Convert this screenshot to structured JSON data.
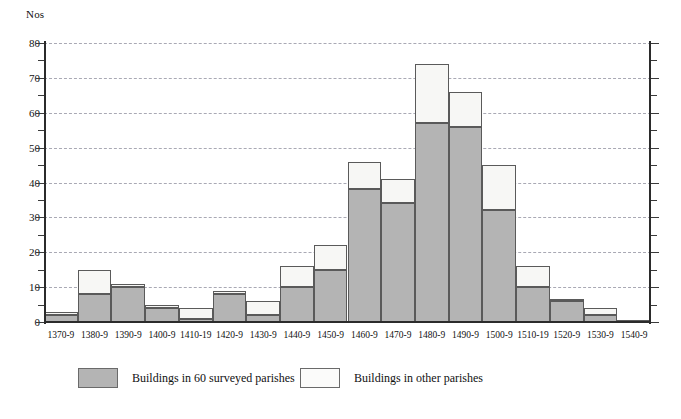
{
  "axis": {
    "unit_label": "Nos",
    "y_ticks": [
      "0",
      "10",
      "20",
      "30",
      "40",
      "50",
      "60",
      "70",
      "80"
    ],
    "y_minor_ticks": [
      "5",
      "15",
      "25",
      "35",
      "45",
      "55",
      "65",
      "75"
    ]
  },
  "legend": {
    "items": [
      {
        "label": "Buildings in 60 surveyed parishes",
        "swatch": "surveyed",
        "color": "#b4b4b4"
      },
      {
        "label": "Buildings in other parishes",
        "swatch": "other",
        "color": "#fbfbfa"
      }
    ]
  },
  "colors": {
    "surveyed_fill": "#b4b4b4",
    "other_fill": "#f7f7f5",
    "bar_border": "#5a5a5a",
    "gridline": "#a9a9b4",
    "axis": "#2b2b2b"
  },
  "chart_data": {
    "type": "bar",
    "title": "",
    "subtitle": "",
    "xlabel": "",
    "ylabel": "Nos",
    "ylim": [
      0,
      80
    ],
    "ytick_step": 10,
    "grid": true,
    "stacked": true,
    "legend_position": "bottom",
    "categories": [
      "1370-9",
      "1380-9",
      "1390-9",
      "1400-9",
      "1410-19",
      "1420-9",
      "1430-9",
      "1440-9",
      "1450-9",
      "1460-9",
      "1470-9",
      "1480-9",
      "1490-9",
      "1500-9",
      "1510-19",
      "1520-9",
      "1530-9",
      "1540-9"
    ],
    "series": [
      {
        "name": "Buildings in 60 surveyed parishes",
        "color": "#b4b4b4",
        "values": [
          2,
          8,
          10,
          4,
          1,
          8,
          2,
          10,
          15,
          38,
          34,
          57,
          56,
          32,
          10,
          6,
          2,
          0
        ]
      },
      {
        "name": "Buildings in other parishes",
        "color": "#f7f7f5",
        "values": [
          1,
          7,
          1,
          1,
          3,
          1,
          4,
          6,
          7,
          8,
          7,
          17,
          10,
          13,
          6,
          0.5,
          2,
          0.5
        ]
      }
    ],
    "totals": [
      3,
      15,
      11,
      5,
      4,
      9,
      6,
      16,
      22,
      46,
      41,
      74,
      66,
      45,
      16,
      6.5,
      4,
      0.5
    ]
  }
}
